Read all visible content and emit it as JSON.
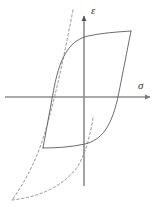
{
  "figure": {
    "background_color": "#ffffff",
    "width": 162,
    "height": 215
  },
  "axes": {
    "horizontal": {
      "label": "σ",
      "label_name": "sigma",
      "meaning": "stress",
      "color": "#8d8d8d",
      "x_start": 5,
      "x_end": 152,
      "y": 97,
      "arrow": "right"
    },
    "vertical": {
      "label": "ε",
      "label_name": "epsilon",
      "meaning": "strain",
      "color": "#8d8d8d",
      "y_start": 186,
      "y_end": 14,
      "x": 84,
      "arrow": "up"
    }
  },
  "curves": {
    "hysteresis_loop": {
      "name": "hysteresis-loop",
      "style": "solid",
      "color": "#5b5b63",
      "stroke_width": 0.9,
      "upper_branch": "M 43 148 L 54 88 C 61 52 72 40 88 36 C 102 33 116 32 131 31",
      "lower_branch": "M 131 31 L 119 92 C 112 128 101 140 85 144 C 71 147 57 148 43 148"
    },
    "backbone_envelope": {
      "name": "backbone-envelope-curve",
      "style": "dashed",
      "color": "#8a8a92",
      "stroke_width": 0.9,
      "dash_pattern": "2.4 2.4",
      "path": "M 73 10 C 66 46 58 86 48 122 C 40 152 28 178 12 200"
    },
    "backbone_envelope_lower": {
      "name": "backbone-envelope-lower-tail",
      "style": "dashed",
      "color": "#8a8a92",
      "stroke_width": 0.9,
      "dash_pattern": "2.4 2.4",
      "path": "M 12 200 C 40 197 64 186 78 166 C 86 152 90 136 93 118"
    }
  },
  "chart_data": {
    "type": "line",
    "xlabel": "σ",
    "ylabel": "ε",
    "grid": false,
    "legend": null,
    "series": [
      {
        "name": "hysteresis-loop-upper-branch",
        "style": "solid",
        "color": "#5b5b63",
        "points": [
          [
            -41,
            -51
          ],
          [
            -30,
            9
          ],
          [
            -23,
            33
          ],
          [
            -12,
            49
          ],
          [
            4,
            57
          ],
          [
            18,
            60
          ],
          [
            32,
            63
          ],
          [
            47,
            66
          ]
        ]
      },
      {
        "name": "hysteresis-loop-lower-branch",
        "style": "solid",
        "color": "#5b5b63",
        "points": [
          [
            47,
            66
          ],
          [
            35,
            5
          ],
          [
            28,
            -19
          ],
          [
            17,
            -35
          ],
          [
            1,
            -43
          ],
          [
            -13,
            -46
          ],
          [
            -27,
            -49
          ],
          [
            -41,
            -51
          ]
        ]
      },
      {
        "name": "backbone-envelope",
        "style": "dashed",
        "color": "#8a8a92",
        "points": [
          [
            -11,
            87
          ],
          [
            -18,
            51
          ],
          [
            -26,
            11
          ],
          [
            -36,
            -25
          ],
          [
            -44,
            -55
          ],
          [
            -56,
            -81
          ],
          [
            -72,
            -103
          ]
        ]
      },
      {
        "name": "backbone-envelope-lower-tail",
        "style": "dashed",
        "color": "#8a8a92",
        "points": [
          [
            -72,
            -103
          ],
          [
            -44,
            -100
          ],
          [
            -20,
            -89
          ],
          [
            -6,
            -69
          ],
          [
            2,
            -55
          ],
          [
            6,
            -39
          ],
          [
            9,
            -21
          ]
        ]
      }
    ],
    "annotations": [
      {
        "text": "σ",
        "x": 54,
        "y": 17,
        "role": "x-axis-label"
      },
      {
        "text": "ε",
        "x": 7,
        "y": 92,
        "role": "y-axis-label"
      }
    ]
  }
}
